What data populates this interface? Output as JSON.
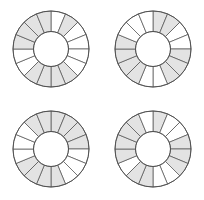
{
  "figure": {
    "background_color": "#ffffff",
    "width": 204,
    "height": 200,
    "grid_rows": 2,
    "grid_cols": 2
  },
  "style": {
    "shaded_fill": "#e3e3e3",
    "empty_fill": "#ffffff",
    "stroke_color": "#4d4d4d",
    "stroke_width": 0.7,
    "sector_count": 16,
    "outer_radius": 38,
    "inner_radius": 17.5,
    "start_angle_deg": -90
  },
  "chart_data": {
    "type": "pie",
    "xlabel": "",
    "ylabel": "",
    "legend": [],
    "annotations": [],
    "sector_count": 16,
    "sector_angle_deg": 22.5,
    "categories": [
      "s1",
      "s2",
      "s3",
      "s4",
      "s5",
      "s6",
      "s7",
      "s8",
      "s9",
      "s10",
      "s11",
      "s12",
      "s13",
      "s14",
      "s15",
      "s16"
    ],
    "values": [
      22.5,
      22.5,
      22.5,
      22.5,
      22.5,
      22.5,
      22.5,
      22.5,
      22.5,
      22.5,
      22.5,
      22.5,
      22.5,
      22.5,
      22.5,
      22.5
    ],
    "series": [
      {
        "name": "top-left",
        "center": [
          51,
          49
        ],
        "shaded": [
          0,
          1,
          0,
          0,
          0,
          0,
          1,
          1,
          1,
          1,
          0,
          0,
          1,
          1,
          1,
          1
        ],
        "shaded_count": 9
      },
      {
        "name": "top-right",
        "center": [
          51,
          49
        ],
        "shaded": [
          1,
          1,
          0,
          0,
          1,
          1,
          1,
          0,
          0,
          1,
          1,
          1,
          1,
          0,
          0,
          0
        ],
        "shaded_count": 9
      },
      {
        "name": "bottom-left",
        "center": [
          51,
          49
        ],
        "shaded": [
          1,
          1,
          1,
          1,
          0,
          0,
          0,
          1,
          1,
          1,
          1,
          0,
          0,
          0,
          1,
          1
        ],
        "shaded_count": 10
      },
      {
        "name": "bottom-right",
        "center": [
          51,
          49
        ],
        "shaded": [
          1,
          0,
          0,
          1,
          1,
          1,
          0,
          0,
          1,
          1,
          0,
          1,
          1,
          1,
          1,
          0
        ],
        "shaded_count": 10
      }
    ]
  },
  "donuts": [
    {
      "id": "donut-top-left",
      "label": "Donut A",
      "row": 0,
      "col": 0,
      "left": 0,
      "top": 0
    },
    {
      "id": "donut-top-right",
      "label": "Donut B",
      "row": 0,
      "col": 1,
      "left": 102,
      "top": 0
    },
    {
      "id": "donut-bottom-left",
      "label": "Donut C",
      "row": 1,
      "col": 0,
      "left": 0,
      "top": 100
    },
    {
      "id": "donut-bottom-right",
      "label": "Donut D",
      "row": 1,
      "col": 1,
      "left": 102,
      "top": 100
    }
  ]
}
